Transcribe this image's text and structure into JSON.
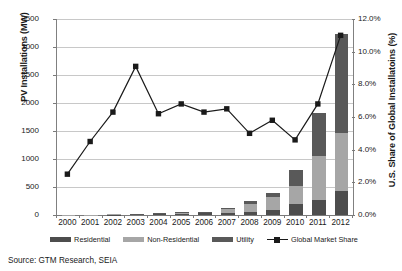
{
  "chart_data": {
    "type": "bar",
    "subtype": "stacked-bar-with-line-overlay",
    "title": "",
    "xlabel": "",
    "ylabel": "PV Installations (MW)",
    "ylabel_secondary": "U.S. Share of Global Installatoins (%)",
    "categories": [
      "2000",
      "2001",
      "2002",
      "2003",
      "2004",
      "2005",
      "2006",
      "2007",
      "2008",
      "2009",
      "2010",
      "2011",
      "2012"
    ],
    "ylim": [
      0,
      3500
    ],
    "yticks": [
      "0",
      "500",
      "1000",
      "1500",
      "2000",
      "2500",
      "3000",
      "3500"
    ],
    "ylim_secondary": [
      0,
      12
    ],
    "yticks_secondary": [
      "0.0%",
      "2.0%",
      "4.0%",
      "6.0%",
      "8.0%",
      "10.0%",
      "12.0%"
    ],
    "grid": true,
    "legend_position": "bottom",
    "series": [
      {
        "name": "Residential",
        "axis": "left",
        "color": "#4d4d4d",
        "type": "bar-segment",
        "values": [
          3,
          5,
          8,
          12,
          18,
          25,
          28,
          40,
          50,
          90,
          190,
          260,
          430
        ]
      },
      {
        "name": "Non-Residential",
        "axis": "left",
        "color": "#a6a6a6",
        "type": "bar-segment",
        "values": [
          2,
          4,
          6,
          12,
          20,
          28,
          30,
          60,
          150,
          240,
          330,
          800,
          1040
        ]
      },
      {
        "name": "Utility",
        "axis": "left",
        "color": "#595959",
        "type": "bar-segment",
        "values": [
          0,
          0,
          0,
          2,
          3,
          4,
          4,
          22,
          50,
          60,
          280,
          770,
          1760
        ]
      },
      {
        "name": "Global Market Share",
        "axis": "right",
        "color": "#1a1a1a",
        "type": "line",
        "marker": "square",
        "values": [
          2.5,
          4.5,
          6.3,
          9.1,
          6.2,
          6.8,
          6.3,
          6.5,
          5.0,
          5.8,
          4.6,
          6.8,
          11.0
        ]
      }
    ],
    "source_note": "Source:  GTM Research, SEIA"
  },
  "legend": {
    "items": [
      {
        "label": "Residential",
        "color": "#4d4d4d",
        "marker": "swatch"
      },
      {
        "label": "Non-Residential",
        "color": "#a6a6a6",
        "marker": "swatch"
      },
      {
        "label": "Utility",
        "color": "#595959",
        "marker": "swatch"
      },
      {
        "label": "Global Market Share",
        "color": "#1a1a1a",
        "marker": "line-square"
      }
    ]
  }
}
